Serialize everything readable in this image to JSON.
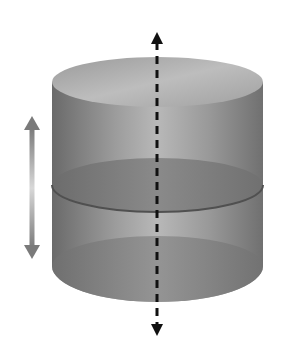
{
  "diagram": {
    "title": "Cylinder with cross-section plane moving along axis",
    "shapes": {
      "cylinder": {
        "left": 52,
        "right": 263,
        "top_cy": 82,
        "bottom_cy": 266,
        "ry": 25
      },
      "cross_section": {
        "cy": 185,
        "ry": 27
      },
      "axis": {
        "x": 157,
        "y1": 33,
        "y2": 335,
        "style": "dashed",
        "direction": "both"
      },
      "motion_arrow": {
        "x": 32,
        "y1": 117,
        "y2": 258,
        "direction": "both"
      }
    },
    "colors": {
      "background": "#ffffff",
      "cylinder_side_dark": "#6e6e6e",
      "cylinder_side_light": "#b5b5b5",
      "top_face": "#a8a8a8",
      "cross_section": "#7d7d7d",
      "axis": "#111111",
      "motion_arrow": "#7a7a7a"
    }
  }
}
